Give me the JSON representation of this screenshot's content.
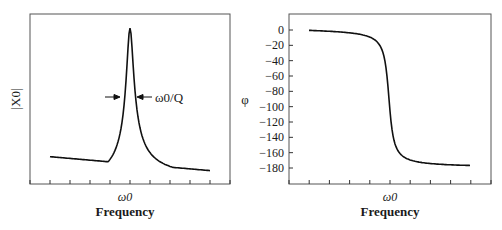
{
  "chart_data": [
    {
      "type": "line",
      "title": "",
      "xlabel": "Frequency",
      "ylabel": "|X0|",
      "xtick_labels": [
        "ω0"
      ],
      "ytick_labels": [],
      "annotation": "ω0/Q",
      "grid": false,
      "legend": null,
      "description": "Resonance amplitude curve (Lorentzian peak at ω0, width ω0/Q)",
      "x": [
        -1.0,
        -0.8,
        -0.6,
        -0.4,
        -0.3,
        -0.2,
        -0.15,
        -0.1,
        -0.05,
        0.0,
        0.05,
        0.1,
        0.15,
        0.2,
        0.3,
        0.4,
        0.6,
        0.8,
        1.0
      ],
      "values": [
        0.1,
        0.11,
        0.13,
        0.17,
        0.21,
        0.29,
        0.37,
        0.5,
        0.75,
        1.0,
        0.75,
        0.5,
        0.37,
        0.29,
        0.21,
        0.17,
        0.12,
        0.09,
        0.06
      ]
    },
    {
      "type": "line",
      "title": "",
      "xlabel": "Frequency",
      "ylabel": "φ",
      "xtick_labels": [
        "ω0"
      ],
      "ytick_labels": [
        "0",
        "−20",
        "−40",
        "−60",
        "−80",
        "−100",
        "−120",
        "−140",
        "−160",
        "−180"
      ],
      "yticks": [
        0,
        -20,
        -40,
        -60,
        -80,
        -100,
        -120,
        -140,
        -160,
        -180
      ],
      "ylim": [
        -200,
        12
      ],
      "grid": false,
      "legend": null,
      "description": "Phase response, falling from 0 to about −175 through −90 at ω0",
      "x": [
        -1.0,
        -0.8,
        -0.6,
        -0.4,
        -0.3,
        -0.2,
        -0.1,
        -0.05,
        0.0,
        0.05,
        0.1,
        0.2,
        0.3,
        0.4,
        0.6,
        0.8,
        1.0
      ],
      "values": [
        0,
        -1,
        -3,
        -6,
        -9,
        -15,
        -35,
        -60,
        -90,
        -120,
        -145,
        -160,
        -166,
        -169,
        -172,
        -174,
        -175
      ]
    }
  ]
}
